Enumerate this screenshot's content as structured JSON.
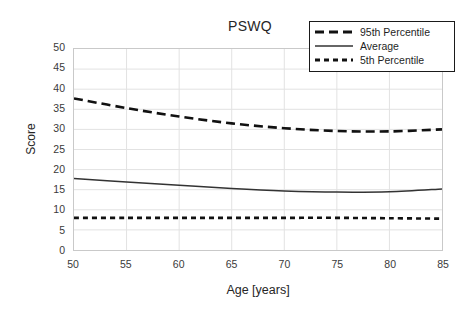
{
  "chart_data": {
    "type": "line",
    "title": "PSWQ",
    "xlabel": "Age [years]",
    "ylabel": "Score",
    "xlim": [
      50,
      85
    ],
    "ylim": [
      0,
      50
    ],
    "xticks": [
      50,
      55,
      60,
      65,
      70,
      75,
      80,
      85
    ],
    "yticks": [
      0,
      5,
      10,
      15,
      20,
      25,
      30,
      35,
      40,
      45,
      50
    ],
    "grid": true,
    "legend_position": "top-right",
    "x": [
      50,
      55,
      60,
      65,
      70,
      75,
      80,
      85
    ],
    "series": [
      {
        "name": "95th Percentile",
        "style": "dashed-long",
        "color": "#111111",
        "values": [
          37.7,
          35.3,
          33.2,
          31.5,
          30.3,
          29.6,
          29.5,
          30.0
        ]
      },
      {
        "name": "Average",
        "style": "solid",
        "color": "#333333",
        "values": [
          17.8,
          16.9,
          16.1,
          15.3,
          14.7,
          14.4,
          14.5,
          15.2
        ]
      },
      {
        "name": "5th Percentile",
        "style": "dashed-short",
        "color": "#111111",
        "values": [
          8.0,
          8.0,
          8.0,
          8.0,
          8.0,
          8.0,
          7.9,
          7.8
        ]
      }
    ],
    "colors": {
      "grid": "#e2e2e2",
      "frame": "#c9c9c9",
      "text": "#262626",
      "legend_border": "#1a1a1a"
    }
  },
  "legend": {
    "items": [
      {
        "label": "95th Percentile"
      },
      {
        "label": "Average"
      },
      {
        "label": "5th Percentile"
      }
    ]
  }
}
